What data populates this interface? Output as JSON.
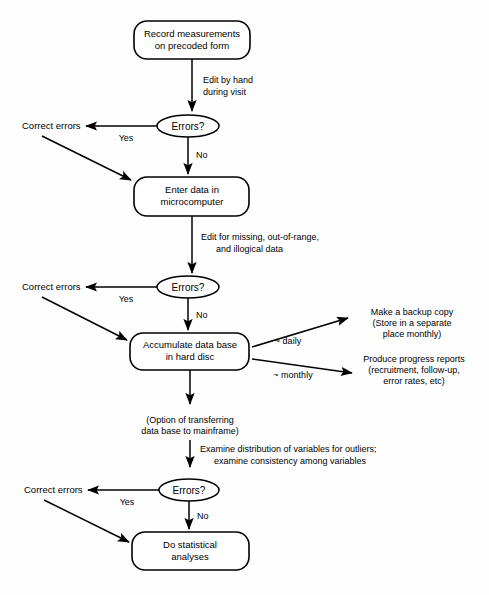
{
  "diagram": {
    "type": "flowchart",
    "stroke_color": "#000000",
    "background_color": "#ffffff",
    "nodes": [
      {
        "id": "record",
        "shape": "rounded-rect",
        "lines": [
          "Record measurements",
          "on precoded form"
        ]
      },
      {
        "id": "errors1",
        "shape": "ellipse",
        "lines": [
          "Errors?"
        ]
      },
      {
        "id": "enter",
        "shape": "rounded-rect",
        "lines": [
          "Enter data in",
          "microcomputer"
        ]
      },
      {
        "id": "errors2",
        "shape": "ellipse",
        "lines": [
          "Errors?"
        ]
      },
      {
        "id": "accumulate",
        "shape": "rounded-rect",
        "lines": [
          "Accumulate data base",
          "in hard disc"
        ]
      },
      {
        "id": "errors3",
        "shape": "ellipse",
        "lines": [
          "Errors?"
        ]
      },
      {
        "id": "analyses",
        "shape": "rounded-rect",
        "lines": [
          "Do statistical",
          "analyses"
        ]
      }
    ],
    "correction_labels": [
      {
        "id": "correct1",
        "text": "Correct errors"
      },
      {
        "id": "correct2",
        "text": "Correct errors"
      },
      {
        "id": "correct3",
        "text": "Correct errors"
      }
    ],
    "edge_labels": {
      "edit_by_hand": [
        "Edit by hand",
        "during visit"
      ],
      "edit_for_missing": [
        "Edit for missing, out-of-range,",
        "and illogical data"
      ],
      "option_transfer": [
        "(Option of transferring",
        "data base to mainframe)"
      ],
      "examine_distribution": [
        "Examine distribution of variables for outliers;",
        "examine consistency among variables"
      ],
      "yes_1": "Yes",
      "no_1": "No",
      "yes_2": "Yes",
      "no_2": "No",
      "yes_3": "Yes",
      "no_3": "No",
      "daily": "~ daily",
      "monthly": "~ monthly"
    },
    "side_outputs": [
      {
        "id": "backup",
        "lines": [
          "Make a backup copy",
          "(Store in a separate",
          "place monthly)"
        ]
      },
      {
        "id": "reports",
        "lines": [
          "Produce progress reports",
          "(recruitment, follow-up,",
          "error rates, etc)"
        ]
      }
    ]
  }
}
